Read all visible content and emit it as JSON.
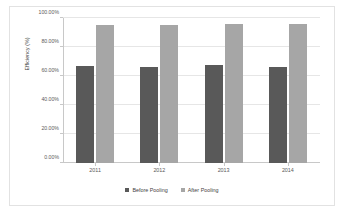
{
  "chart_data": {
    "type": "bar",
    "title": "",
    "subtitle": "",
    "xlabel": "",
    "ylabel": "Efficiency (%)",
    "categories": [
      "2011",
      "2012",
      "2013",
      "2014"
    ],
    "series": [
      {
        "name": "Before Pooling",
        "color": "#595959",
        "values": [
          67.0,
          66.0,
          67.5,
          66.0
        ]
      },
      {
        "name": "After Pooling",
        "color": "#a6a6a6",
        "values": [
          95.5,
          95.2,
          96.0,
          95.8
        ]
      }
    ],
    "ylim": [
      0,
      100
    ],
    "ytick_values": [
      0,
      20,
      40,
      60,
      80,
      100
    ],
    "ytick_labels": [
      "0.00%",
      "20.00%",
      "40.00%",
      "60.00%",
      "80.00%",
      "100.00%"
    ],
    "grid": true,
    "legend_position": "bottom",
    "value_suffix": "%"
  },
  "legend": {
    "items": [
      {
        "label": "Before Pooling",
        "color": "#595959"
      },
      {
        "label": "After Pooling",
        "color": "#a6a6a6"
      }
    ]
  },
  "colors": {
    "before_pooling": "#595959",
    "after_pooling": "#a6a6a6",
    "gridline": "#e6e6e6",
    "axis": "#c8c8c8",
    "frame_border": "#e2e2e2",
    "background": "#ffffff",
    "tick_text": "#5a5a5a",
    "title_text": "#3f3f3f"
  }
}
